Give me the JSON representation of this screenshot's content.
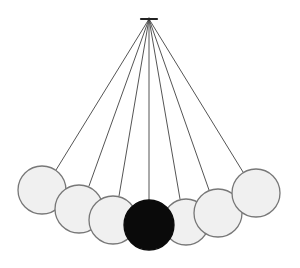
{
  "diagram": {
    "pivot": {
      "x": 149,
      "y": 19,
      "bar_x1": 141,
      "bar_x2": 157
    },
    "colors": {
      "background": "#ffffff",
      "string": "#555555",
      "ball_fill": "#f0f0f0",
      "ball_stroke": "#777777",
      "highlight_ball_fill": "#0a0a0a",
      "pivot": "#222222"
    },
    "balls": [
      {
        "id": 1,
        "cx": 42,
        "cy": 190,
        "r": 24,
        "highlight": false,
        "string_end": [
          56,
          170
        ]
      },
      {
        "id": 2,
        "cx": 79,
        "cy": 209,
        "r": 24,
        "highlight": false,
        "string_end": [
          89,
          186
        ]
      },
      {
        "id": 3,
        "cx": 113,
        "cy": 220,
        "r": 24,
        "highlight": false,
        "string_end": [
          119,
          196
        ]
      },
      {
        "id": 5,
        "cx": 186,
        "cy": 222,
        "r": 23,
        "highlight": false,
        "string_end": [
          180,
          199
        ]
      },
      {
        "id": 6,
        "cx": 218,
        "cy": 213,
        "r": 24,
        "highlight": false,
        "string_end": [
          209,
          190
        ]
      },
      {
        "id": 7,
        "cx": 256,
        "cy": 193,
        "r": 24,
        "highlight": false,
        "string_end": [
          243,
          172
        ]
      },
      {
        "id": 4,
        "cx": 149,
        "cy": 225,
        "r": 25,
        "highlight": true,
        "string_end": [
          149,
          200
        ]
      }
    ]
  }
}
